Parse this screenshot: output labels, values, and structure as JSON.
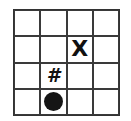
{
  "grid": {
    "rows": 4,
    "cols": 4,
    "cells": [
      [
        "",
        "",
        "",
        ""
      ],
      [
        "",
        "",
        "X",
        ""
      ],
      [
        "",
        "#",
        "",
        ""
      ],
      [
        "",
        "dot",
        "",
        ""
      ]
    ]
  },
  "markers": {
    "x": {
      "label": "X",
      "row": 1,
      "col": 2
    },
    "hash": {
      "label": "#",
      "row": 2,
      "col": 1
    },
    "dot": {
      "icon": "filled-circle-icon",
      "row": 3,
      "col": 1,
      "color": "#151515"
    }
  }
}
